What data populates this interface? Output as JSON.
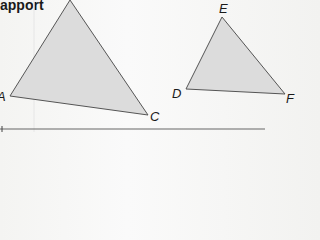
{
  "heading": "apport",
  "figure": {
    "fill_color": "#dcdcdc",
    "stroke_color": "#555555",
    "triangle_abc": {
      "labels": {
        "A": "A",
        "C": "C"
      }
    },
    "triangle_def": {
      "labels": {
        "D": "D",
        "E": "E",
        "F": "F"
      }
    }
  }
}
